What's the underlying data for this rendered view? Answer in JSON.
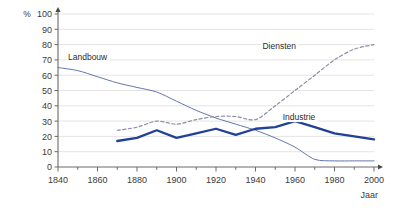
{
  "chart_data": {
    "type": "line",
    "title": "",
    "xlabel": "Jaar",
    "ylabel": "%",
    "xlim": [
      1840,
      2000
    ],
    "ylim": [
      0,
      100
    ],
    "grid": true,
    "legend_position": "inline-annotations",
    "xticks": [
      1840,
      1860,
      1880,
      1900,
      1920,
      1940,
      1960,
      1980,
      2000
    ],
    "xminor_step": 10,
    "yticks": [
      0,
      10,
      20,
      30,
      40,
      50,
      60,
      70,
      80,
      90,
      100
    ],
    "series": [
      {
        "name": "Landbouw",
        "style": "thin-solid",
        "color": "#5b6fa8",
        "x": [
          1840,
          1850,
          1860,
          1870,
          1880,
          1890,
          1900,
          1910,
          1920,
          1930,
          1940,
          1950,
          1960,
          1970,
          1980,
          1990,
          2000
        ],
        "values": [
          65,
          63,
          59,
          55,
          52,
          49,
          43,
          37,
          32,
          28,
          24,
          19,
          13,
          5,
          4,
          4,
          4
        ]
      },
      {
        "name": "Industrie",
        "style": "thick-solid",
        "color": "#21409a",
        "x": [
          1870,
          1880,
          1890,
          1900,
          1910,
          1920,
          1930,
          1940,
          1950,
          1960,
          1970,
          1980,
          1990,
          2000
        ],
        "values": [
          17,
          19,
          24,
          19,
          22,
          25,
          21,
          25,
          26,
          30,
          26,
          22,
          20,
          18
        ]
      },
      {
        "name": "Diensten",
        "style": "dashed",
        "color": "#8a8fa6",
        "x": [
          1870,
          1880,
          1890,
          1900,
          1910,
          1920,
          1930,
          1940,
          1950,
          1960,
          1970,
          1980,
          1990,
          2000
        ],
        "values": [
          24,
          26,
          30,
          28,
          31,
          33,
          33,
          31,
          40,
          50,
          60,
          70,
          77,
          80
        ]
      }
    ],
    "annotations": [
      {
        "text": "Landbouw",
        "x": 1855,
        "y": 70
      },
      {
        "text": "Diensten",
        "x": 1952,
        "y": 77
      },
      {
        "text": "Industrie",
        "x": 1962,
        "y": 31
      }
    ]
  }
}
